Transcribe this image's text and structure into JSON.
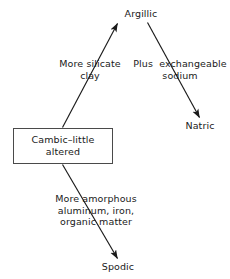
{
  "diagram": {
    "background_color": "#ffffff",
    "line_color": "#1a1a1a",
    "box_border_color": "#4a4a4a",
    "text_color": "#1a1a1a",
    "nodes": {
      "cambic": {
        "label": "Cambic–little\naltered",
        "shape": "rectangle"
      },
      "argillic": {
        "label": "Argillic",
        "shape": "text"
      },
      "natric": {
        "label": "Natric",
        "shape": "text"
      },
      "spodic": {
        "label": "Spodic",
        "shape": "text"
      }
    },
    "edges": [
      {
        "from": "cambic",
        "to": "argillic",
        "label": "More silicate\nclay"
      },
      {
        "from": "argillic",
        "to": "natric",
        "label": "Plus  exchangeable\nsodium"
      },
      {
        "from": "cambic",
        "to": "spodic",
        "label": "More amorphous\naluminum, iron,\norganic matter"
      }
    ]
  }
}
